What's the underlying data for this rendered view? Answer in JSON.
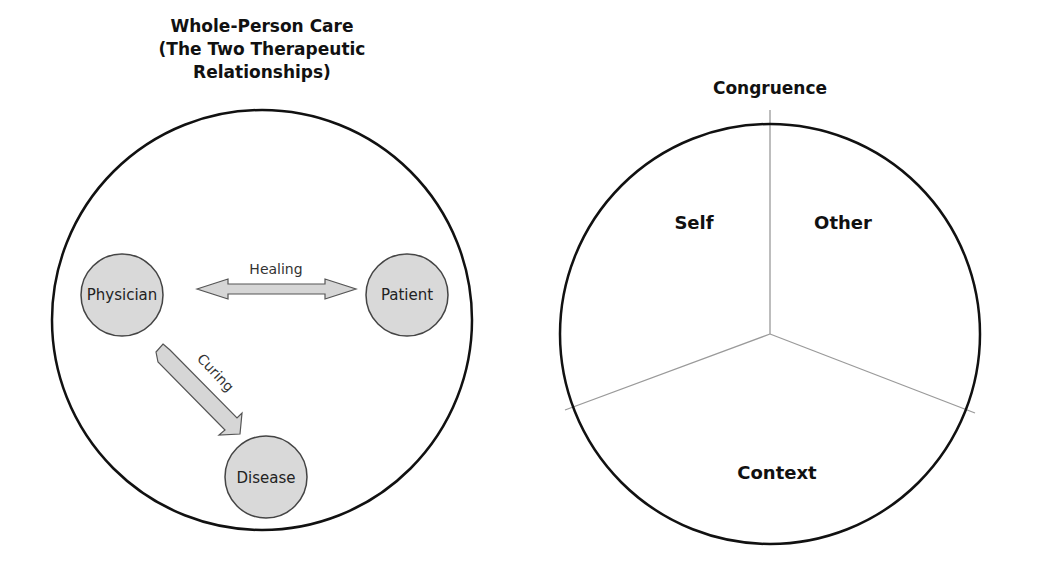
{
  "left_diagram": {
    "title_lines": [
      "Whole-Person Care",
      "(The Two Therapeutic",
      "Relationships)"
    ],
    "nodes": {
      "physician": "Physician",
      "patient": "Patient",
      "disease": "Disease"
    },
    "relations": {
      "healing": "Healing",
      "curing": "Curing"
    }
  },
  "right_diagram": {
    "title": "Congruence",
    "segments": {
      "self": "Self",
      "other": "Other",
      "context": "Context"
    }
  },
  "colors": {
    "node_fill": "#d9d9d9",
    "outline": "#111111",
    "divider": "#9a9a9a",
    "arrow_fill": "#d6d6d6"
  }
}
